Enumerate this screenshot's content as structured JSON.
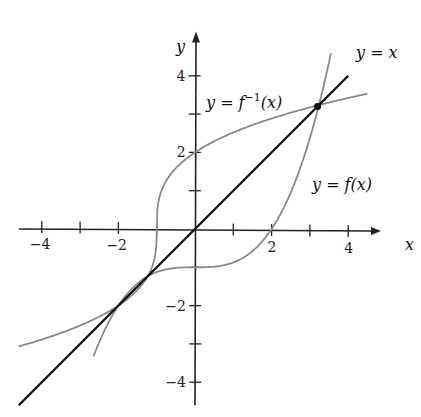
{
  "chart_data": {
    "type": "line",
    "title": "",
    "xlabel": "x",
    "ylabel": "y",
    "xlim": [
      -4.6,
      4.7
    ],
    "ylim": [
      -4.6,
      5.0
    ],
    "grid": false,
    "x_ticks": [
      -4,
      -3,
      -2,
      -1,
      1,
      2,
      3,
      4
    ],
    "x_tick_labels": {
      "-4": "−4",
      "-2": "−2",
      "2": "2",
      "4": "4"
    },
    "y_ticks": [
      -4,
      -3,
      -2,
      -1,
      1,
      2,
      3,
      4
    ],
    "y_tick_labels": {
      "-4": "−4",
      "-2": "−2",
      "2": "2",
      "4": "4"
    },
    "series": [
      {
        "name": "y = f(x)",
        "label_main": "y = f(x)",
        "color": "#8a8a8a",
        "formula": "x^3/8 - 1",
        "points": [
          [
            -2.65,
            -3.33
          ],
          [
            -2.4,
            -2.73
          ],
          [
            -2,
            -2
          ],
          [
            -1.24,
            -1.24
          ],
          [
            -1,
            -1.125
          ],
          [
            0,
            -1
          ],
          [
            1,
            -0.875
          ],
          [
            2,
            0
          ],
          [
            2.5,
            0.95
          ],
          [
            3.2,
            3.2
          ],
          [
            3.5,
            4.36
          ]
        ]
      },
      {
        "name": "y = f⁻¹(x)",
        "label_main": "y = f",
        "label_sup": "−1",
        "label_tail": "(x)",
        "color": "#8a8a8a",
        "formula": "cbrt(8(x+1))",
        "points": [
          [
            -4.6,
            -2.95
          ],
          [
            -3,
            -2.52
          ],
          [
            -2,
            -2
          ],
          [
            -1.24,
            -1.24
          ],
          [
            -1.125,
            -1
          ],
          [
            -1,
            0
          ],
          [
            -0.875,
            1
          ],
          [
            0,
            2
          ],
          [
            1,
            2.52
          ],
          [
            3.2,
            3.2
          ],
          [
            4.5,
            3.3
          ]
        ]
      },
      {
        "name": "y = x",
        "label_main": "y = x",
        "color": "#111111",
        "formula": "x",
        "points": [
          [
            -4.6,
            -4.6
          ],
          [
            4,
            4
          ]
        ]
      }
    ],
    "intersection_points": [
      [
        3.2,
        3.2
      ]
    ],
    "axis_color": "#222222"
  }
}
